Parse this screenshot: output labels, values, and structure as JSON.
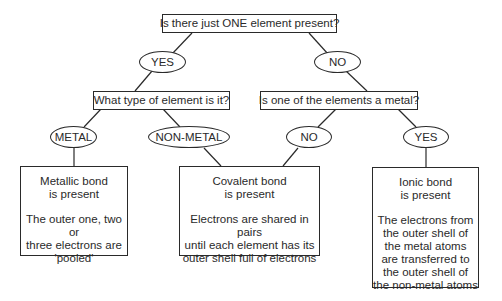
{
  "diagram": {
    "type": "decision-tree",
    "root_question": "Is there just ONE element present?",
    "branches": {
      "yes": {
        "label": "YES",
        "question": "What type of element is it?",
        "options": {
          "metal": {
            "label": "METAL",
            "result_title_1": "Metallic bond",
            "result_title_2": "is present",
            "result_desc": [
              "The outer one, two or",
              "three electrons are",
              "'pooled'"
            ]
          },
          "non_metal": {
            "label": "NON-METAL"
          }
        }
      },
      "no": {
        "label": "NO",
        "question": "Is one of the elements a metal?",
        "options": {
          "no": {
            "label": "NO"
          },
          "yes": {
            "label": "YES",
            "result_title_1": "Ionic bond",
            "result_title_2": "is present",
            "result_desc": [
              "The electrons from",
              "the outer shell of",
              "the metal atoms",
              "are transferred to",
              "the outer shell of",
              "the non-metal atoms"
            ]
          }
        }
      }
    },
    "covalent": {
      "result_title_1": "Covalent bond",
      "result_title_2": "is present",
      "result_desc": [
        "Electrons are shared in pairs",
        "until each element has its",
        "outer shell full of electrons"
      ]
    }
  },
  "colors": {
    "line": "#2a2a2a",
    "background": "#ffffff",
    "text": "#2a2a2a"
  }
}
